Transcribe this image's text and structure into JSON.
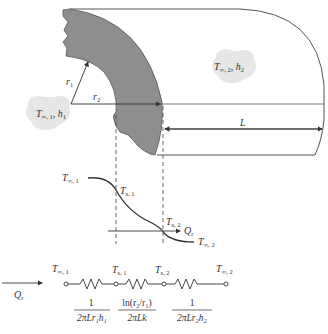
{
  "diagram": {
    "type": "cylindrical wall heat conduction with thermal resistance network",
    "labels": {
      "inner_fluid": {
        "T": "T",
        "sub": "∞, 1",
        "h": "h",
        "hsub": "1"
      },
      "outer_fluid": {
        "T": "T",
        "sub": "∞, 2",
        "h": "h",
        "hsub": "2"
      },
      "r1": {
        "main": "r",
        "sub": "1"
      },
      "r2": {
        "main": "r",
        "sub": "2"
      },
      "length": "L"
    },
    "profile": {
      "T_inf1": {
        "main": "T",
        "sub": "∞, 1"
      },
      "Ts1": {
        "main": "T",
        "sub": "s, 1"
      },
      "Ts2": {
        "main": "T",
        "sub": "s, 2"
      },
      "T_inf2": {
        "main": "T",
        "sub": "∞, 2"
      },
      "heat_flow": {
        "main": "Q",
        "sub": "r"
      }
    },
    "circuit": {
      "heat_flow": {
        "main": "Q",
        "sub": "r"
      },
      "nodes": [
        {
          "main": "T",
          "sub": "∞, 1"
        },
        {
          "main": "T",
          "sub": "s, 1"
        },
        {
          "main": "T",
          "sub": "s, 2"
        },
        {
          "main": "T",
          "sub": "∞, 2"
        }
      ],
      "resistances": [
        {
          "numerator": "1",
          "denominator": "2πLr₁h₁"
        },
        {
          "numerator": "ln(r₂/r₁)",
          "denominator": "2πLk"
        },
        {
          "numerator": "1",
          "denominator": "2πLr₂h₂"
        }
      ]
    },
    "colors": {
      "wall_fill": "#8a8a8a",
      "line": "#333333",
      "cloud": "#e4e4e4"
    }
  }
}
